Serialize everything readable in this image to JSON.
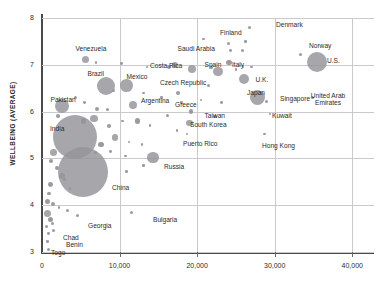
{
  "chart": {
    "type": "scatter",
    "ylabel": "WELLBEING (AVERAGE)",
    "xlabel": "",
    "title": "",
    "grid": true,
    "legend": "none",
    "xlim": [
      0,
      42800
    ],
    "ylim": [
      2.7,
      8.0
    ],
    "yticks": [
      "8",
      "7",
      "6",
      "5",
      "4",
      "3"
    ],
    "ytick_values": [
      8,
      7,
      6,
      5,
      4,
      3
    ],
    "xticks": [
      "0",
      "10,000",
      "20,000",
      "30,000",
      "40,000"
    ],
    "xtick_values": [
      0,
      10000,
      20000,
      30000,
      40000
    ],
    "colors": {
      "bubble": "#949499",
      "grid": "#c9c9cf",
      "axis": "#4a4a4a",
      "text": "#2b2b2b"
    }
  },
  "chart_data": {
    "type": "scatter",
    "title": "",
    "xlabel": "",
    "ylabel": "WELLBEING (AVERAGE)",
    "xlim": [
      0,
      42800
    ],
    "ylim": [
      2.7,
      8.0
    ],
    "grid": true,
    "legend": "none",
    "note": "Bubble size encodes population. x = GDP per capita, y = wellbeing (average, 0-10 ladder).",
    "points": [
      {
        "name": "Venezuela",
        "x": 5600,
        "y": 7.12,
        "r": 3.5,
        "label": true,
        "lx": 91,
        "ly": 45,
        "anchor": "center"
      },
      {
        "name": "Costa Rica",
        "x": 10200,
        "y": 7.02,
        "r": 1.4,
        "label": true,
        "lx": 150,
        "ly": 62,
        "anchor": "left"
      },
      {
        "name": "Denmark",
        "x": 26800,
        "y": 7.8,
        "r": 1.6,
        "label": true,
        "lx": 276,
        "ly": 21,
        "anchor": "left"
      },
      {
        "name": "Finland",
        "x": 24100,
        "y": 7.45,
        "r": 1.5,
        "label": true,
        "lx": 231,
        "ly": 29,
        "anchor": "center"
      },
      {
        "name": "Norway",
        "x": 33300,
        "y": 7.22,
        "r": 1.6,
        "label": true,
        "lx": 320,
        "ly": 42,
        "anchor": "center"
      },
      {
        "name": "U.S.",
        "x": 35500,
        "y": 7.05,
        "r": 10.0,
        "label": true,
        "lx": 327,
        "ly": 57,
        "anchor": "left"
      },
      {
        "name": "Saudi Arabia",
        "x": 17100,
        "y": 7.0,
        "r": 3.0,
        "label": true,
        "lx": 196,
        "ly": 45,
        "anchor": "center"
      },
      {
        "name": "Spain",
        "x": 19400,
        "y": 6.9,
        "r": 4.0,
        "label": true,
        "lx": 213,
        "ly": 61,
        "anchor": "center"
      },
      {
        "name": "Italy",
        "x": 22700,
        "y": 6.85,
        "r": 4.6,
        "label": true,
        "lx": 238,
        "ly": 61,
        "anchor": "center"
      },
      {
        "name": "Brazil",
        "x": 8200,
        "y": 6.55,
        "r": 9.0,
        "label": true,
        "lx": 96,
        "ly": 70,
        "anchor": "center"
      },
      {
        "name": "Mexico",
        "x": 10900,
        "y": 6.55,
        "r": 6.4,
        "label": true,
        "lx": 137,
        "ly": 73,
        "anchor": "center"
      },
      {
        "name": "U.K.",
        "x": 26100,
        "y": 6.7,
        "r": 5.0,
        "label": true,
        "lx": 262,
        "ly": 76,
        "anchor": "center"
      },
      {
        "name": "Czech Republic",
        "x": 17500,
        "y": 6.4,
        "r": 2.0,
        "label": true,
        "lx": 183,
        "ly": 79,
        "anchor": "center"
      },
      {
        "name": "Japan",
        "x": 27800,
        "y": 6.3,
        "r": 7.8,
        "label": true,
        "lx": 256,
        "ly": 89,
        "anchor": "center"
      },
      {
        "name": "Singapore",
        "x": 28900,
        "y": 6.22,
        "r": 1.6,
        "label": true,
        "lx": 280,
        "ly": 95,
        "anchor": "left"
      },
      {
        "name": "Pakistan",
        "x": 2600,
        "y": 6.12,
        "r": 7.0,
        "label": true,
        "lx": 63,
        "ly": 96,
        "anchor": "center"
      },
      {
        "name": "Argentina",
        "x": 11700,
        "y": 6.15,
        "r": 4.0,
        "label": true,
        "lx": 141,
        "ly": 97,
        "anchor": "left"
      },
      {
        "name": "Greece",
        "x": 19200,
        "y": 6.0,
        "r": 2.2,
        "label": true,
        "lx": 186,
        "ly": 101,
        "anchor": "center"
      },
      {
        "name": "United Arab Emirates",
        "x": 34900,
        "y": 6.3,
        "r": 1.6,
        "label": true,
        "lx": 328,
        "ly": 92,
        "anchor": "center",
        "two_line": true
      },
      {
        "name": "Taiwan",
        "x": 22300,
        "y": 5.9,
        "r": 1.6,
        "label": true,
        "lx": 215,
        "ly": 112,
        "anchor": "center"
      },
      {
        "name": "Kuwait",
        "x": 29400,
        "y": 5.95,
        "r": 1.4,
        "label": true,
        "lx": 272,
        "ly": 112,
        "anchor": "left"
      },
      {
        "name": "South Korea",
        "x": 19000,
        "y": 5.75,
        "r": 3.2,
        "label": true,
        "lx": 190,
        "ly": 121,
        "anchor": "left"
      },
      {
        "name": "India",
        "x": 4300,
        "y": 5.45,
        "r": 22.0,
        "label": true,
        "lx": 50,
        "ly": 125,
        "anchor": "left"
      },
      {
        "name": "Puerto Rico",
        "x": 18700,
        "y": 5.52,
        "r": 1.4,
        "label": true,
        "lx": 183,
        "ly": 140,
        "anchor": "left"
      },
      {
        "name": "Hong Kong",
        "x": 28700,
        "y": 5.52,
        "r": 1.4,
        "label": true,
        "lx": 262,
        "ly": 142,
        "anchor": "left"
      },
      {
        "name": "Russia",
        "x": 14300,
        "y": 5.02,
        "r": 5.6,
        "label": true,
        "lx": 164,
        "ly": 163,
        "anchor": "left"
      },
      {
        "name": "China",
        "x": 5300,
        "y": 4.7,
        "r": 25.0,
        "label": true,
        "lx": 112,
        "ly": 184,
        "anchor": "left"
      },
      {
        "name": "Bulgaria",
        "x": 11600,
        "y": 3.85,
        "r": 1.5,
        "label": true,
        "lx": 153,
        "ly": 216,
        "anchor": "left"
      },
      {
        "name": "Georgia",
        "x": 4600,
        "y": 3.78,
        "r": 1.5,
        "label": true,
        "lx": 88,
        "ly": 222,
        "anchor": "left"
      },
      {
        "name": "Chad",
        "x": 1300,
        "y": 3.6,
        "r": 1.5,
        "label": true,
        "lx": 63,
        "ly": 234,
        "anchor": "left"
      },
      {
        "name": "Benin",
        "x": 1500,
        "y": 3.45,
        "r": 1.5,
        "label": true,
        "lx": 66,
        "ly": 241,
        "anchor": "left"
      },
      {
        "name": "Togo",
        "x": 900,
        "y": 3.05,
        "r": 1.5,
        "label": true,
        "lx": 51,
        "ly": 249,
        "anchor": "left"
      }
    ],
    "unlabeled_points": [
      {
        "x": 7000,
        "y": 7.05,
        "r": 1.2
      },
      {
        "x": 13500,
        "y": 6.95,
        "r": 1.2
      },
      {
        "x": 20800,
        "y": 7.55,
        "r": 1.3
      },
      {
        "x": 24100,
        "y": 7.05,
        "r": 2.8
      },
      {
        "x": 24300,
        "y": 7.3,
        "r": 1.4
      },
      {
        "x": 25900,
        "y": 7.3,
        "r": 1.5
      },
      {
        "x": 26200,
        "y": 7.5,
        "r": 1.3
      },
      {
        "x": 21900,
        "y": 6.95,
        "r": 1.6
      },
      {
        "x": 25000,
        "y": 6.9,
        "r": 1.4
      },
      {
        "x": 25900,
        "y": 6.95,
        "r": 1.3
      },
      {
        "x": 27000,
        "y": 6.95,
        "r": 1.3
      },
      {
        "x": 16400,
        "y": 6.95,
        "r": 2.0
      },
      {
        "x": 21400,
        "y": 6.55,
        "r": 1.5
      },
      {
        "x": 9200,
        "y": 6.45,
        "r": 1.6
      },
      {
        "x": 13100,
        "y": 6.4,
        "r": 1.3
      },
      {
        "x": 15400,
        "y": 6.3,
        "r": 1.3
      },
      {
        "x": 18000,
        "y": 6.2,
        "r": 1.3
      },
      {
        "x": 20500,
        "y": 6.25,
        "r": 1.4
      },
      {
        "x": 23100,
        "y": 6.2,
        "r": 1.4
      },
      {
        "x": 4300,
        "y": 6.3,
        "r": 1.8
      },
      {
        "x": 5500,
        "y": 6.2,
        "r": 1.4
      },
      {
        "x": 7100,
        "y": 6.05,
        "r": 2.0
      },
      {
        "x": 8400,
        "y": 6.05,
        "r": 1.5
      },
      {
        "x": 6700,
        "y": 5.85,
        "r": 3.6
      },
      {
        "x": 5400,
        "y": 5.8,
        "r": 2.6
      },
      {
        "x": 8600,
        "y": 5.7,
        "r": 2.0
      },
      {
        "x": 10400,
        "y": 5.8,
        "r": 1.3
      },
      {
        "x": 12300,
        "y": 5.8,
        "r": 2.6
      },
      {
        "x": 13900,
        "y": 5.7,
        "r": 1.3
      },
      {
        "x": 16200,
        "y": 5.92,
        "r": 1.5
      },
      {
        "x": 17400,
        "y": 5.6,
        "r": 1.3
      },
      {
        "x": 2100,
        "y": 5.9,
        "r": 2.0
      },
      {
        "x": 9400,
        "y": 5.45,
        "r": 3.2
      },
      {
        "x": 11200,
        "y": 5.35,
        "r": 1.3
      },
      {
        "x": 12900,
        "y": 5.3,
        "r": 1.4
      },
      {
        "x": 7600,
        "y": 5.3,
        "r": 2.6
      },
      {
        "x": 8800,
        "y": 5.15,
        "r": 1.4
      },
      {
        "x": 10800,
        "y": 5.05,
        "r": 1.3
      },
      {
        "x": 6900,
        "y": 5.12,
        "r": 1.6
      },
      {
        "x": 1500,
        "y": 5.12,
        "r": 3.4
      },
      {
        "x": 1200,
        "y": 4.95,
        "r": 2.2
      },
      {
        "x": 1900,
        "y": 4.8,
        "r": 2.0
      },
      {
        "x": 2600,
        "y": 4.62,
        "r": 3.0
      },
      {
        "x": 1100,
        "y": 4.45,
        "r": 2.4
      },
      {
        "x": 900,
        "y": 4.25,
        "r": 1.6
      },
      {
        "x": 700,
        "y": 4.08,
        "r": 2.6
      },
      {
        "x": 1400,
        "y": 4.02,
        "r": 2.0
      },
      {
        "x": 2200,
        "y": 3.95,
        "r": 1.4
      },
      {
        "x": 3300,
        "y": 3.88,
        "r": 1.5
      },
      {
        "x": 700,
        "y": 3.82,
        "r": 3.6
      },
      {
        "x": 1100,
        "y": 3.7,
        "r": 2.6
      },
      {
        "x": 600,
        "y": 3.55,
        "r": 1.7
      },
      {
        "x": 800,
        "y": 3.4,
        "r": 1.4
      },
      {
        "x": 700,
        "y": 3.22,
        "r": 1.3
      },
      {
        "x": 2900,
        "y": 4.55,
        "r": 1.4
      },
      {
        "x": 3600,
        "y": 4.35,
        "r": 1.4
      },
      {
        "x": 13100,
        "y": 4.85,
        "r": 1.3
      },
      {
        "x": 10900,
        "y": 4.72,
        "r": 1.3
      }
    ]
  }
}
